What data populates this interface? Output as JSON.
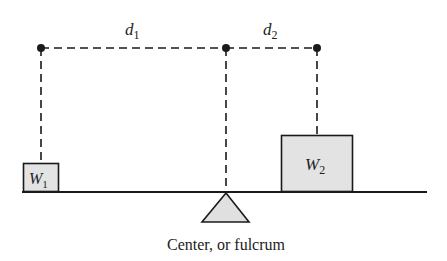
{
  "diagram": {
    "distance_labels": {
      "d1": {
        "main": "d",
        "sub": "1"
      },
      "d2": {
        "main": "d",
        "sub": "2"
      }
    },
    "weights": {
      "w1": {
        "main": "W",
        "sub": "1"
      },
      "w2": {
        "main": "W",
        "sub": "2"
      }
    },
    "caption": "Center, or fulcrum",
    "colors": {
      "line": "#1a1a1a",
      "box_fill": "#e3e3e3",
      "fulcrum_fill": "#e0e0e0"
    }
  }
}
